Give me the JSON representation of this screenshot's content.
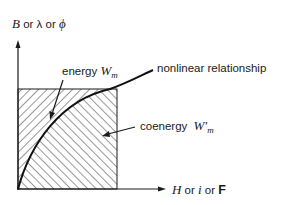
{
  "diagram": {
    "y_axis": {
      "label_parts": [
        {
          "text": "B",
          "style": "italic"
        },
        {
          "text": " or ",
          "style": "normal"
        },
        {
          "text": "λ",
          "style": "normal"
        },
        {
          "text": " or ",
          "style": "normal"
        },
        {
          "text": "ϕ",
          "style": "italic"
        }
      ]
    },
    "x_axis": {
      "label_parts": [
        {
          "text": "H",
          "style": "italic"
        },
        {
          "text": " or ",
          "style": "normal"
        },
        {
          "text": "i",
          "style": "italic"
        },
        {
          "text": " or ",
          "style": "normal"
        },
        {
          "text": "F",
          "style": "bold"
        }
      ]
    },
    "regions": {
      "energy": {
        "word": "energy",
        "symbol": "W",
        "subscript": "m",
        "hatch": "forward-slash",
        "location": "above curve, left of box"
      },
      "coenergy": {
        "word": "coenergy",
        "symbol": "W'",
        "subscript": "m",
        "hatch": "back-slash",
        "location": "below curve, inside box"
      }
    },
    "curve": {
      "label": "nonlinear relationship",
      "shape": "concave saturating curve from origin"
    },
    "colors": {
      "line": "#1a1a1a",
      "background": "#ffffff",
      "hatch": "#333333"
    }
  }
}
